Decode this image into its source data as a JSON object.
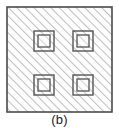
{
  "figure": {
    "caption": "(b)",
    "kind": "cross-section-diagram",
    "colors": {
      "background": "#ffffff",
      "outline": "#4a4a4a",
      "hatch_line": "#8c8c8c",
      "fill": "#fdfdfd",
      "inclusion_outline": "#555555",
      "caption_text": "#1a1a1a"
    },
    "outer_square": {
      "label": "outer-hatched-square",
      "x": 7,
      "y": 7,
      "width": 105,
      "height": 105,
      "stroke_width": 1.5
    },
    "hatching": {
      "label": "diagonal-hatch-pattern",
      "angle_degrees": 45,
      "direction": "lower-left-to-upper-right",
      "spacing_px": 6,
      "line_width": 1.1
    },
    "inclusions": [
      {
        "name": "inclusion-top-left",
        "outer": {
          "x": 34,
          "y": 31,
          "width": 20,
          "height": 20
        },
        "inner": {
          "x": 38,
          "y": 35,
          "width": 12,
          "height": 12
        }
      },
      {
        "name": "inclusion-top-right",
        "outer": {
          "x": 73,
          "y": 31,
          "width": 20,
          "height": 20
        },
        "inner": {
          "x": 77,
          "y": 35,
          "width": 12,
          "height": 12
        }
      },
      {
        "name": "inclusion-bottom-left",
        "outer": {
          "x": 34,
          "y": 75,
          "width": 20,
          "height": 20
        },
        "inner": {
          "x": 38,
          "y": 79,
          "width": 12,
          "height": 12
        }
      },
      {
        "name": "inclusion-bottom-right",
        "outer": {
          "x": 73,
          "y": 75,
          "width": 20,
          "height": 20
        },
        "inner": {
          "x": 77,
          "y": 79,
          "width": 12,
          "height": 12
        }
      }
    ]
  }
}
